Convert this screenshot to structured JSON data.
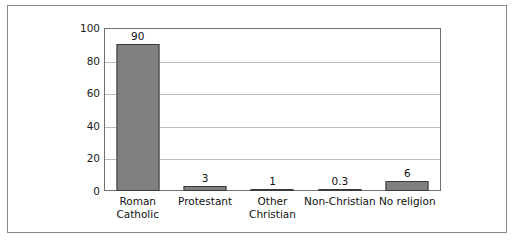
{
  "chart_data": {
    "type": "bar",
    "title": "",
    "subtitle": "",
    "xlabel": "",
    "ylabel": "",
    "ylim": [
      0,
      100
    ],
    "yticks": [
      "0",
      "20",
      "40",
      "60",
      "80",
      "100"
    ],
    "ytick_values": [
      0,
      20,
      40,
      60,
      80,
      100
    ],
    "grid": "horizontal",
    "legend": "none",
    "categories": [
      "Roman Catholic",
      "Protestant",
      "Other Christian",
      "Non-Christian",
      "No religion"
    ],
    "category_lines": [
      [
        "Roman",
        "Catholic"
      ],
      [
        "Protestant",
        ""
      ],
      [
        "Other",
        "Christian"
      ],
      [
        "Non-Christian",
        ""
      ],
      [
        "No religion",
        ""
      ]
    ],
    "values": [
      90,
      3,
      1,
      0.3,
      6
    ],
    "value_labels": [
      "90",
      "3",
      "1",
      "0.3",
      "6"
    ],
    "colors": {
      "bar_fill": "#808080",
      "bar_edge": "#3a3a3a",
      "gridline": "#bdbdbd",
      "axis": "#6f6f6f",
      "frame": "#8a8a8a",
      "background": "#ffffff",
      "text": "#111111"
    }
  }
}
